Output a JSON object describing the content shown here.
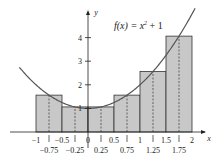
{
  "chart_data": {
    "type": "bar",
    "subtype": "riemann-sum-midpoint",
    "function": "x^2 + 1",
    "xlabel": "x",
    "ylabel": "y",
    "xlim": [
      -1.3,
      2.2
    ],
    "ylim": [
      0,
      4.6
    ],
    "x_ticks_major": [
      -1,
      -0.5,
      0,
      0.5,
      1,
      1.5,
      2
    ],
    "x_tick_labels_major": [
      "−1",
      "−0.5",
      "0",
      "0.5",
      "1",
      "1.5",
      "2"
    ],
    "x_ticks_midpoints": [
      -0.75,
      -0.25,
      0.25,
      0.75,
      1.25,
      1.75
    ],
    "x_tick_labels_midpoints": [
      "−0.75",
      "−0.25",
      "0.25",
      "0.75",
      "1.25",
      "1.75"
    ],
    "y_ticks": [
      1,
      2,
      3,
      4
    ],
    "y_tick_labels": [
      "1",
      "2",
      "3",
      "4"
    ],
    "bars": [
      {
        "x0": -1,
        "x1": -0.5,
        "midpoint": -0.75,
        "height": 1.5625
      },
      {
        "x0": -0.5,
        "x1": 0,
        "midpoint": -0.25,
        "height": 1.0625
      },
      {
        "x0": 0,
        "x1": 0.5,
        "midpoint": 0.25,
        "height": 1.0625
      },
      {
        "x0": 0.5,
        "x1": 1,
        "midpoint": 0.75,
        "height": 1.5625
      },
      {
        "x0": 1,
        "x1": 1.5,
        "midpoint": 1.25,
        "height": 2.5625
      },
      {
        "x0": 1.5,
        "x1": 2,
        "midpoint": 1.75,
        "height": 4.0625
      }
    ],
    "categories": [
      "-0.75",
      "-0.25",
      "0.25",
      "0.75",
      "1.25",
      "1.75"
    ],
    "values": [
      1.5625,
      1.0625,
      1.0625,
      1.5625,
      2.5625,
      4.0625
    ],
    "colors": {
      "bar_fill": "#c8c8c8",
      "bar_stroke": "#333333",
      "curve": "#555555",
      "axis": "#222222"
    },
    "grid": false,
    "legend": null
  },
  "labels": {
    "title_f": "f(x) = x",
    "title_exp": "2",
    "title_rest": " + 1",
    "x_axis": "x",
    "y_axis": "y"
  }
}
